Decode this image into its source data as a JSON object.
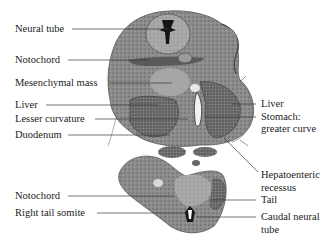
{
  "diagram": {
    "labels_left": [
      {
        "id": "neural-tube",
        "text": "Neural tube"
      },
      {
        "id": "notochord-upper",
        "text": "Notochord"
      },
      {
        "id": "mesenchymal-mass",
        "text": "Mesenchymal mass"
      },
      {
        "id": "liver-left",
        "text": "Liver"
      },
      {
        "id": "lesser-curvature",
        "text": "Lesser curvature"
      },
      {
        "id": "duodenum",
        "text": "Duodenum"
      },
      {
        "id": "notochord-lower",
        "text": "Notochord"
      },
      {
        "id": "right-tail-somite",
        "text": "Right tail somite"
      }
    ],
    "labels_right": [
      {
        "id": "liver-right",
        "text": "Liver"
      },
      {
        "id": "stomach-line1",
        "text": "Stomach:"
      },
      {
        "id": "stomach-line2",
        "text": "greater curve"
      },
      {
        "id": "hepatoenteric-line1",
        "text": "Hepatoenteric"
      },
      {
        "id": "hepatoenteric-line2",
        "text": "recessus"
      },
      {
        "id": "tail",
        "text": "Tail"
      },
      {
        "id": "caudal-neural-line1",
        "text": "Caudal neural"
      },
      {
        "id": "caudal-neural-line2",
        "text": "tube"
      }
    ],
    "colors": {
      "tissue_dark": "#5a5a5a",
      "tissue_mid": "#8a8a8a",
      "tissue_light": "#b8b8b8",
      "leader_line": "#3a3a3a",
      "background": "#ffffff"
    }
  }
}
